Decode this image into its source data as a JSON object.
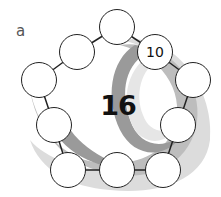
{
  "label": "a",
  "center_value": "16",
  "nodes": [
    {
      "id": "top",
      "value": ""
    },
    {
      "id": "upper-left",
      "value": ""
    },
    {
      "id": "upper-right",
      "value": "10"
    },
    {
      "id": "left",
      "value": ""
    },
    {
      "id": "right",
      "value": ""
    },
    {
      "id": "lower-left",
      "value": ""
    },
    {
      "id": "lower-right",
      "value": ""
    },
    {
      "id": "bottom-left",
      "value": ""
    },
    {
      "id": "bottom-middle",
      "value": ""
    },
    {
      "id": "bottom-right",
      "value": ""
    }
  ],
  "colors": {
    "swirl_dark": "#9a9a9a",
    "swirl_mid": "#bdbdbd",
    "swirl_light": "#dcdcdc",
    "stroke": "#222222"
  }
}
